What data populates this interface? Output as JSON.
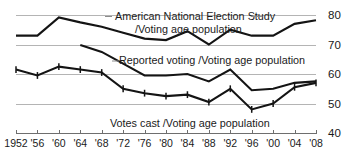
{
  "chart_data": {
    "type": "line",
    "title": "",
    "subtitle": "",
    "xlabel": "",
    "ylabel": "",
    "xlim": [
      1952,
      2008
    ],
    "ylim": [
      40,
      80
    ],
    "grid": true,
    "grid_axis": "y",
    "legend_position": "inline-annotations",
    "x": [
      1952,
      1956,
      1960,
      1964,
      1968,
      1972,
      1976,
      1980,
      1984,
      1988,
      1992,
      1996,
      2000,
      2004,
      2008
    ],
    "xtick_labels": [
      "1952",
      "'56",
      "'60",
      "'64",
      "'68",
      "'72",
      "'76",
      "'80",
      "'84",
      "'88",
      "'92",
      "'96",
      "'00",
      "'04",
      "'08"
    ],
    "ytick_labels": [
      "80",
      "70",
      "60",
      "50",
      "40"
    ],
    "yticks": [
      80,
      70,
      60,
      50,
      40
    ],
    "series": [
      {
        "name": "American National Election Study /Voting age population",
        "markers": false,
        "x": [
          1952,
          1956,
          1960,
          1964,
          1968,
          1972,
          1976,
          1980,
          1984,
          1988,
          1992,
          1996,
          2000,
          2004,
          2008
        ],
        "values": [
          73.0,
          73.0,
          79.2,
          77.5,
          76.0,
          74.0,
          72.0,
          71.5,
          74.5,
          70.0,
          75.0,
          73.0,
          73.0,
          77.0,
          78.2
        ]
      },
      {
        "name": "Reported voting /Voting age population",
        "markers": false,
        "x": [
          1964,
          1968,
          1972,
          1976,
          1980,
          1984,
          1988,
          1992,
          1996,
          2000,
          2004,
          2008
        ],
        "values": [
          69.8,
          67.5,
          63.5,
          59.5,
          59.5,
          60.0,
          57.5,
          61.5,
          54.5,
          55.0,
          57.0,
          57.5
        ]
      },
      {
        "name": "Votes cast /Voting age population",
        "markers": true,
        "x": [
          1952,
          1956,
          1960,
          1964,
          1968,
          1972,
          1976,
          1980,
          1984,
          1988,
          1992,
          1996,
          2000,
          2004,
          2008
        ],
        "values": [
          61.5,
          59.5,
          62.5,
          61.5,
          60.5,
          55.0,
          53.5,
          52.5,
          53.0,
          50.5,
          55.0,
          48.0,
          50.0,
          55.5,
          57.0
        ]
      }
    ],
    "annotations": [
      {
        "id": "anes-label-line1",
        "text": "American National Election Study",
        "x_px": 115,
        "y_px": 20,
        "leader_left": true,
        "leader_right": true
      },
      {
        "id": "anes-label-line2",
        "text": "/Voting age population",
        "x_px": 135,
        "y_px": 33
      },
      {
        "id": "reported-voting-label",
        "text": "Reported voting /Voting age population",
        "x_px": 119,
        "y_px": 64
      },
      {
        "id": "votes-cast-label",
        "text": "Votes cast /Voting age population",
        "x_px": 110,
        "y_px": 127
      }
    ]
  }
}
